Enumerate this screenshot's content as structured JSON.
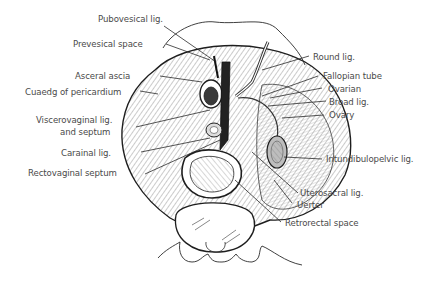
{
  "figure": {
    "labels_left": [
      {
        "id": "pubovesical",
        "text": "Pubovesical lig."
      },
      {
        "id": "prevesical",
        "text": "Prevesical space"
      },
      {
        "id": "visceral-fascia",
        "text": "Asceral ascia"
      },
      {
        "id": "cuaedg",
        "text": "Cuaedg of pericardium"
      },
      {
        "id": "viscerovaginal-1",
        "text": "Viscerovaginal lig."
      },
      {
        "id": "viscerovaginal-2",
        "text": "and septum"
      },
      {
        "id": "cardinal",
        "text": "Carainal lig."
      },
      {
        "id": "rectovaginal",
        "text": "Rectovaginal septum"
      }
    ],
    "labels_right": [
      {
        "id": "round",
        "text": "Round lig."
      },
      {
        "id": "fallopian",
        "text": "Fallopian tube"
      },
      {
        "id": "ovarian",
        "text": "Ovarian"
      },
      {
        "id": "broad",
        "text": "Broad lig."
      },
      {
        "id": "ovary",
        "text": "Ovary"
      },
      {
        "id": "infundibulopelvic",
        "text": "Intundibulopelvic lig."
      },
      {
        "id": "uterosacral",
        "text": "Uterosacral lig."
      },
      {
        "id": "ureter",
        "text": "Uerter"
      },
      {
        "id": "retrorectal",
        "text": "Retrorectal space"
      }
    ],
    "colors": {
      "line": "#2a2a2a",
      "text": "#4a4a4a",
      "shade": "#8a8a8a",
      "background": "#ffffff"
    }
  }
}
